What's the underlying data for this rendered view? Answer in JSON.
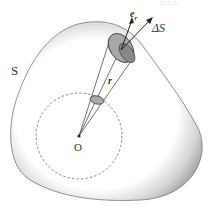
{
  "diagram": {
    "labels": {
      "surface": "S",
      "origin": "O",
      "radius_vector": "r",
      "unit_vector": "e",
      "unit_vector_sub": "r",
      "area_element": "ΔS",
      "corner_caption": "(2.1.2)"
    },
    "colors": {
      "surface_shade": "#9a9a9a",
      "outline": "#555555",
      "ellipse_fill": "#a8a8a8"
    }
  }
}
